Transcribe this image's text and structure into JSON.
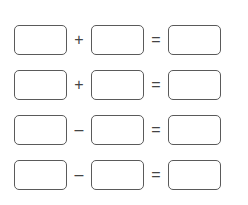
{
  "worksheet": {
    "rows": [
      {
        "operator": "+",
        "equals": "=",
        "answer_a": "",
        "answer_b": "",
        "result": ""
      },
      {
        "operator": "+",
        "equals": "=",
        "answer_a": "",
        "answer_b": "",
        "result": ""
      },
      {
        "operator": "–",
        "equals": "=",
        "answer_a": "",
        "answer_b": "",
        "result": ""
      },
      {
        "operator": "–",
        "equals": "=",
        "answer_a": "",
        "answer_b": "",
        "result": ""
      }
    ]
  },
  "colors": {
    "box_border": "#5a5a5a",
    "operator": "#444444",
    "background": "#ffffff"
  }
}
